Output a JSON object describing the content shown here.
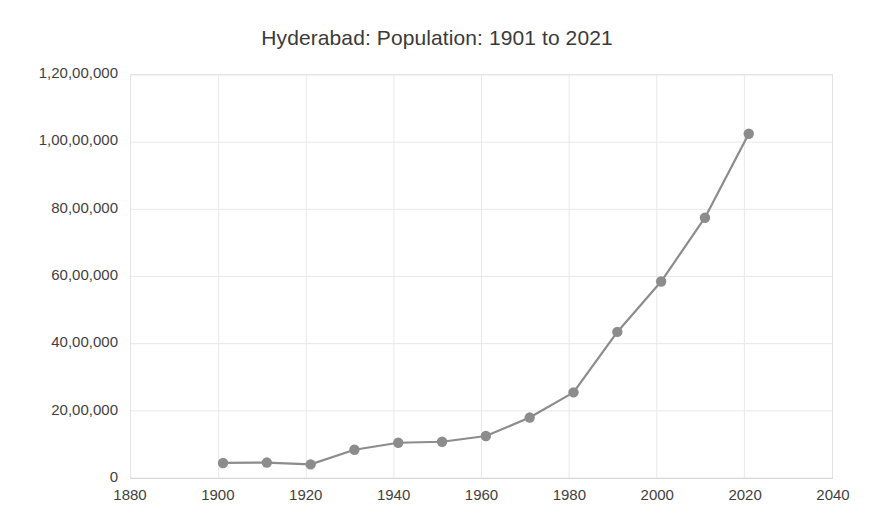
{
  "chart_data": {
    "type": "line",
    "title": "Hyderabad: Population: 1901 to 2021",
    "xlabel": "",
    "ylabel": "",
    "xlim": [
      1880,
      2040
    ],
    "ylim": [
      0,
      12000000
    ],
    "x_ticks": [
      1880,
      1900,
      1920,
      1940,
      1960,
      1980,
      2000,
      2020,
      2040
    ],
    "x_tick_labels": [
      "1880",
      "1900",
      "1920",
      "1940",
      "1960",
      "1980",
      "2000",
      "2020",
      "2040"
    ],
    "y_ticks": [
      0,
      2000000,
      4000000,
      6000000,
      8000000,
      10000000,
      12000000
    ],
    "y_tick_labels": [
      "0",
      "20,00,000",
      "40,00,000",
      "60,00,000",
      "80,00,000",
      "1,00,00,000",
      "1,20,00,000"
    ],
    "grid": true,
    "legend": "none",
    "x": [
      1901,
      1911,
      1921,
      1931,
      1941,
      1951,
      1961,
      1971,
      1981,
      1991,
      2001,
      2011,
      2021
    ],
    "values": [
      448000,
      460000,
      405000,
      840000,
      1050000,
      1080000,
      1250000,
      1800000,
      2550000,
      4350000,
      5850000,
      7750000,
      10250000
    ],
    "series": [
      {
        "name": "Population",
        "values": [
          448000,
          460000,
          405000,
          840000,
          1050000,
          1080000,
          1250000,
          1800000,
          2550000,
          4350000,
          5850000,
          7750000,
          10250000
        ]
      }
    ],
    "line_color": "#8c8c8c",
    "marker_color": "#8c8c8c",
    "grid_color": "#e8e8e8"
  }
}
